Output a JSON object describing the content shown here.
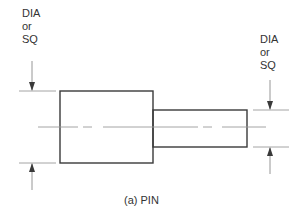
{
  "figure": {
    "caption": "(a) PIN",
    "labels": {
      "left": {
        "line1": "DIA",
        "line2": "or",
        "line3": "SQ"
      },
      "right": {
        "line1": "DIA",
        "line2": "or",
        "line3": "SQ"
      }
    },
    "colors": {
      "outline": "#3a3a3a",
      "thin_line": "#8a8a8a",
      "centerline": "#9a9a9a",
      "text": "#333333",
      "background": "#ffffff"
    },
    "parts": {
      "head": {
        "shape": "rectangle",
        "description": "larger diameter section"
      },
      "shank": {
        "shape": "rectangle",
        "description": "smaller diameter section"
      }
    }
  }
}
